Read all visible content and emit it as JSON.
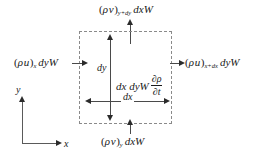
{
  "figure": {
    "background_color": "#ffffff",
    "box_border_color": "#8a8a8a",
    "arrow_color": "#2b2b2b"
  },
  "control_volume": {
    "label": "dashed-control-volume"
  },
  "flux_labels": {
    "top": {
      "lead": "(",
      "rho": "ρ",
      "vel": "v",
      "close": ")",
      "subscript": "y+dy",
      "tail": "dxW",
      "full": "(ρ v)y+dy dxW"
    },
    "bottom": {
      "lead": "(",
      "rho": "ρ",
      "vel": "v",
      "close": ")",
      "subscript": "y",
      "tail": "dxW",
      "full": "(ρ v)y dxW"
    },
    "left": {
      "lead": "(",
      "rho": "ρ",
      "vel": "u",
      "close": ")",
      "subscript": "x",
      "tail": "dyW",
      "full": "(ρ u)x dyW"
    },
    "right": {
      "lead": "(",
      "rho": "ρ",
      "vel": "u",
      "close": ")",
      "subscript": "x+dx",
      "tail": "dyW",
      "full": "(ρ u)x+dx dyW"
    }
  },
  "storage_term": {
    "prefix": "dx dyW",
    "numerator": "∂ρ",
    "denominator": "∂t",
    "full": "dx dyW ∂ρ/∂t"
  },
  "dimensions": {
    "vertical": "dy",
    "horizontal": "dx"
  },
  "axes": {
    "x_label": "x",
    "y_label": "y"
  }
}
